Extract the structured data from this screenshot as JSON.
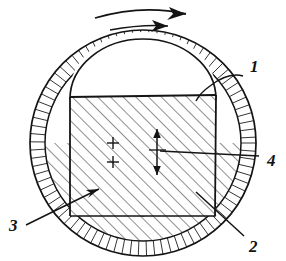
{
  "figure": {
    "type": "technical-cross-section-drawing",
    "title": "",
    "style": "hand-drawn ink line drawing, hatched cross-section",
    "background_color": "#ffffff",
    "line_color": "#141414",
    "hatch_color": "#2a2a2a",
    "view": "vertical cross-section through a spherical vessel"
  },
  "rotation_indicator": {
    "name": "rotation-arrows",
    "count": 2,
    "direction": "clockwise-right",
    "arrows": [
      {
        "id": "outer",
        "shape": "curved",
        "points_to": "right"
      },
      {
        "id": "inner",
        "shape": "shallow",
        "points_to": "right"
      }
    ]
  },
  "geometry": {
    "outer_circle": {
      "cx": 143,
      "cy": 143,
      "r": 113
    },
    "inner_circle": {
      "cx": 143,
      "cy": 143,
      "r": 98
    },
    "core_rect": {
      "x": 70,
      "y": 96,
      "width": 146,
      "height": 120
    },
    "dome": {
      "cx": 143,
      "cy": 96,
      "rx": 73,
      "ry": 58
    }
  },
  "callouts": [
    {
      "id": "1",
      "label": "1",
      "label_x": 250,
      "label_y": 72,
      "leader_from": [
        243,
        75
      ],
      "leader_to": [
        205,
        92
      ],
      "points_at": "outer-shell-wall-upper-right",
      "has_arrowhead": false
    },
    {
      "id": "2",
      "label": "2",
      "label_x": 249,
      "label_y": 247,
      "leader_from": [
        243,
        238
      ],
      "leader_to": [
        196,
        193
      ],
      "points_at": "lower-right-core-and-shell-junction",
      "has_arrowhead": false
    },
    {
      "id": "3",
      "label": "3",
      "label_x": 12,
      "label_y": 228,
      "leader_from": [
        27,
        224
      ],
      "leader_to": [
        97,
        190
      ],
      "points_at": "hatched-core-lower-left",
      "has_arrowhead": true
    },
    {
      "id": "4",
      "label": "4",
      "label_x": 268,
      "label_y": 163,
      "leader_from": [
        260,
        155
      ],
      "leader_to": [
        160,
        152
      ],
      "points_at": "center-dimension-marker",
      "has_arrowhead": false
    }
  ],
  "center_marks": {
    "name": "center-axis-marks",
    "crosses": [
      {
        "x": 113,
        "y": 143
      },
      {
        "x": 113,
        "y": 162
      }
    ],
    "dimension_marker": {
      "x": 157,
      "y_top": 129,
      "y_bottom": 175,
      "style": "vertical double arrow"
    }
  },
  "hatching": {
    "shell_band": {
      "style": "radial",
      "spacing_deg": 4.2
    },
    "core_body": {
      "style": "diagonal-45",
      "direction": "lower-left-to-upper-right",
      "spacing_px": 9
    },
    "bottom_lune": {
      "style": "diagonal-45",
      "direction": "lower-left-to-upper-right",
      "spacing_px": 9
    }
  }
}
